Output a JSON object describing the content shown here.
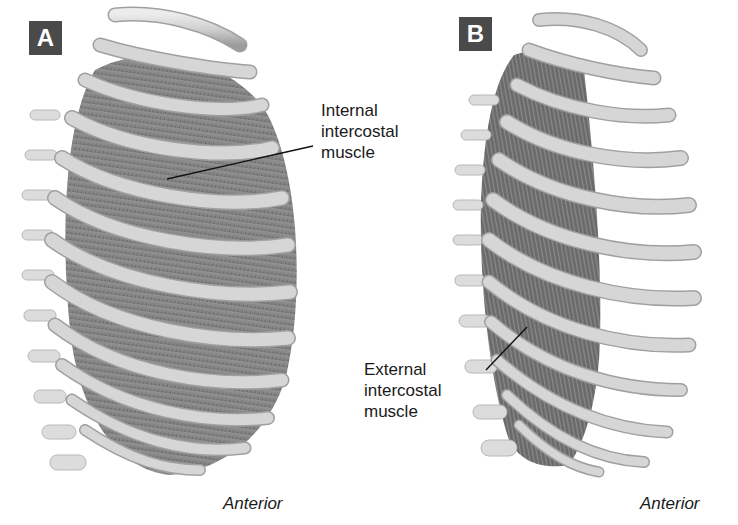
{
  "figure": {
    "panels": [
      {
        "id": "A",
        "letter": "A",
        "view_caption": "Anterior",
        "structure_label": "Internal\nintercostal\nmuscle"
      },
      {
        "id": "B",
        "letter": "B",
        "view_caption": "Anterior",
        "structure_label": "External\nintercostal\nmuscle"
      }
    ],
    "colors": {
      "badge_background": "#4a4a4a",
      "badge_text": "#ffffff",
      "bone": "#d4d4d4",
      "bone_shadow": "#9a9a9a",
      "muscle": "#8a8a8a",
      "muscle_dark": "#5e5e5e",
      "leader_line": "#111111",
      "text": "#1a1a1a"
    }
  }
}
